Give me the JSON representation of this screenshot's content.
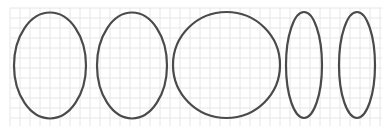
{
  "canvas": {
    "width": 386,
    "height": 134,
    "background": "#ffffff"
  },
  "grid": {
    "x": 10,
    "y": 8,
    "width": 372,
    "height": 118,
    "spacing": 10,
    "color": "#e6e6e6"
  },
  "stroke": {
    "color": "#4a4a4a",
    "width": 2.2
  },
  "ellipses": [
    {
      "name": "ellipse-1",
      "cx": 50,
      "cy": 65.5,
      "rx": 36,
      "ry": 53
    },
    {
      "name": "ellipse-2",
      "cx": 132,
      "cy": 65.5,
      "rx": 35,
      "ry": 53
    },
    {
      "name": "ellipse-3",
      "cx": 226.5,
      "cy": 65,
      "rx": 53.5,
      "ry": 53
    },
    {
      "name": "ellipse-4",
      "cx": 304,
      "cy": 65,
      "rx": 18,
      "ry": 53
    },
    {
      "name": "ellipse-5",
      "cx": 357,
      "cy": 65,
      "rx": 18,
      "ry": 53
    }
  ]
}
